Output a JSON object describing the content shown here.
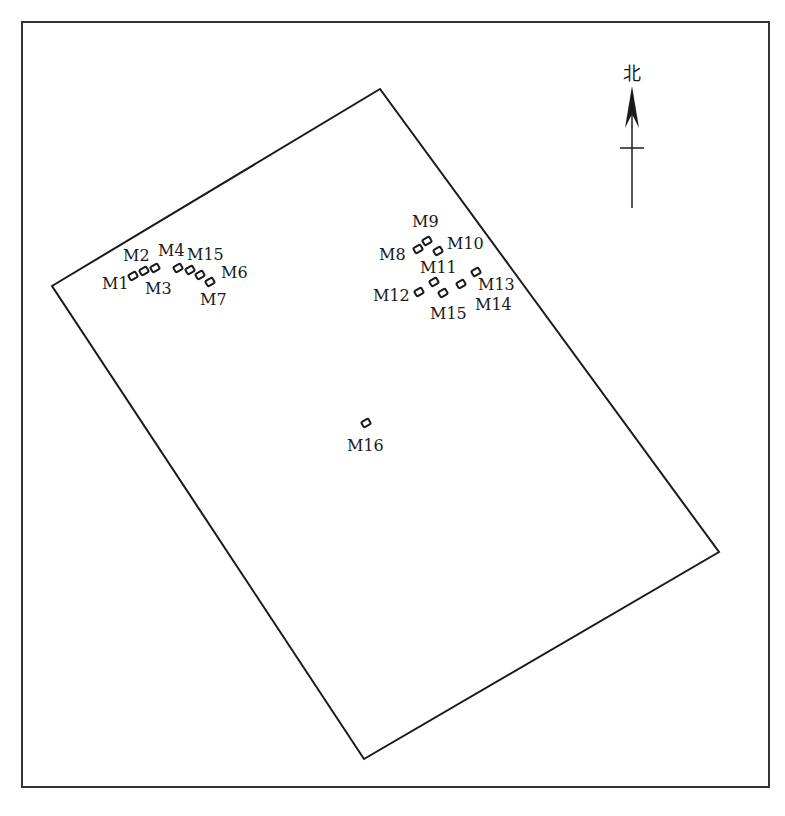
{
  "diagram": {
    "type": "site-plan",
    "frame": {
      "x": 22,
      "y": 22,
      "width": 747,
      "height": 765,
      "stroke": "#333333"
    },
    "boundary": {
      "stroke": "#1a1a1a",
      "vertices": [
        [
          52,
          286
        ],
        [
          380,
          89
        ],
        [
          719,
          552
        ],
        [
          364,
          759
        ]
      ]
    },
    "north_arrow": {
      "label": "北",
      "x": 632,
      "label_y": 80,
      "tip_y": 86,
      "base_y": 208,
      "crossbar_y": 148
    },
    "graves": [
      {
        "id": "M1",
        "label": "M1",
        "x": 133,
        "y": 276,
        "lx": 102,
        "ly": 289
      },
      {
        "id": "M2",
        "label": "M2",
        "x": 144,
        "y": 271,
        "lx": 123,
        "ly": 261
      },
      {
        "id": "M3",
        "label": "M3",
        "x": 155,
        "y": 268,
        "lx": 145,
        "ly": 294
      },
      {
        "id": "M4",
        "label": "M4",
        "x": 178,
        "y": 268,
        "lx": 158,
        "ly": 256
      },
      {
        "id": "M15a",
        "label": "M15",
        "x": 190,
        "y": 270,
        "lx": 187,
        "ly": 260
      },
      {
        "id": "M6",
        "label": "M6",
        "x": 200,
        "y": 275,
        "lx": 221,
        "ly": 278
      },
      {
        "id": "M7",
        "label": "M7",
        "x": 210,
        "y": 282,
        "lx": 200,
        "ly": 305
      },
      {
        "id": "M8",
        "label": "M8",
        "x": 418,
        "y": 249,
        "lx": 379,
        "ly": 260
      },
      {
        "id": "M9",
        "label": "M9",
        "x": 427,
        "y": 241,
        "lx": 412,
        "ly": 227
      },
      {
        "id": "M10",
        "label": "M10",
        "x": 438,
        "y": 251,
        "lx": 447,
        "ly": 249
      },
      {
        "id": "M11",
        "label": "M11",
        "x": 434,
        "y": 282,
        "lx": 420,
        "ly": 273
      },
      {
        "id": "M12",
        "label": "M12",
        "x": 419,
        "y": 292,
        "lx": 373,
        "ly": 301
      },
      {
        "id": "M13",
        "label": "M13",
        "x": 476,
        "y": 272,
        "lx": 478,
        "ly": 290
      },
      {
        "id": "M14",
        "label": "M14",
        "x": 461,
        "y": 284,
        "lx": 475,
        "ly": 310
      },
      {
        "id": "M15b",
        "label": "M15",
        "x": 443,
        "y": 293,
        "lx": 430,
        "ly": 319
      },
      {
        "id": "M16",
        "label": "M16",
        "x": 366,
        "y": 423,
        "lx": 347,
        "ly": 451
      }
    ]
  }
}
